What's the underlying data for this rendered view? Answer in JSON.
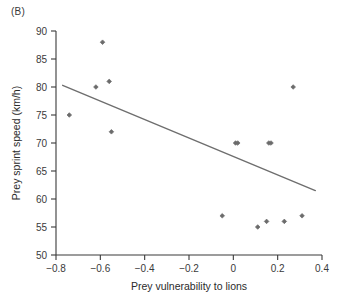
{
  "panel": {
    "label": "(B)"
  },
  "chart_data": {
    "type": "scatter",
    "title": "",
    "subtitle": "",
    "xlabel": "Prey vulnerability to lions",
    "ylabel": "Prey sprint speed (km/h)",
    "xlim": [
      -0.8,
      0.4
    ],
    "ylim": [
      50,
      90
    ],
    "xticks": [
      -0.8,
      -0.6,
      -0.4,
      -0.2,
      0,
      0.2,
      0.4
    ],
    "xtick_labels": [
      "−0.8",
      "−0.6",
      "−0.4",
      "−0.2",
      "0",
      "0.2",
      "0.4"
    ],
    "yticks": [
      50,
      55,
      60,
      65,
      70,
      75,
      80,
      85,
      90
    ],
    "ytick_labels": [
      "50",
      "55",
      "60",
      "65",
      "70",
      "75",
      "80",
      "85",
      "90"
    ],
    "grid": false,
    "legend": null,
    "legend_position": "none",
    "marker": "diamond",
    "marker_color": "#6b6b6b",
    "axis_color": "#3a3a3a",
    "series": [
      {
        "name": "Prey species",
        "points": [
          {
            "x": -0.74,
            "y": 75
          },
          {
            "x": -0.62,
            "y": 80
          },
          {
            "x": -0.59,
            "y": 88
          },
          {
            "x": -0.56,
            "y": 81
          },
          {
            "x": -0.55,
            "y": 72
          },
          {
            "x": -0.05,
            "y": 57
          },
          {
            "x": 0.01,
            "y": 70
          },
          {
            "x": 0.02,
            "y": 70
          },
          {
            "x": 0.11,
            "y": 55
          },
          {
            "x": 0.15,
            "y": 56
          },
          {
            "x": 0.16,
            "y": 70
          },
          {
            "x": 0.17,
            "y": 70
          },
          {
            "x": 0.23,
            "y": 56
          },
          {
            "x": 0.27,
            "y": 80
          },
          {
            "x": 0.31,
            "y": 57
          }
        ]
      }
    ],
    "trendline": {
      "name": "fitted regression line",
      "color": "#6e6e6e",
      "x_start": -0.77,
      "y_start": 80.3,
      "x_end": 0.37,
      "y_end": 61.5
    }
  }
}
